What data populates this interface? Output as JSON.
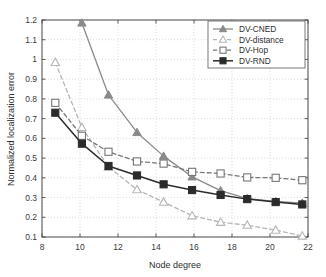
{
  "chart_data": {
    "type": "line",
    "title": "",
    "xlabel": "Node degree",
    "ylabel": "Normalized localization error",
    "xlim": [
      8,
      22
    ],
    "ylim": [
      0.1,
      1.2
    ],
    "xticks": [
      8,
      10,
      12,
      14,
      16,
      18,
      20,
      22
    ],
    "yticks": [
      0.1,
      0.2,
      0.3,
      0.4,
      0.5,
      0.6,
      0.7,
      0.8,
      0.9,
      1.0,
      1.1,
      1.2
    ],
    "ytick_labels": [
      "0.1",
      "0.2",
      "0.3",
      "0.4",
      "0.5",
      "0.6",
      "0.7",
      "0.8",
      "0.9",
      "1",
      "1.1",
      "1.2"
    ],
    "xtick_labels": [
      "8",
      "10",
      "12",
      "14",
      "16",
      "18",
      "20",
      "22"
    ],
    "grid": true,
    "legend_position": "top-right",
    "series": [
      {
        "name": "DV-CNED",
        "color": "#8a8a8a",
        "marker": "triangle-filled",
        "linestyle": "solid",
        "x": [
          10.1,
          11.5,
          13.0,
          14.4,
          15.9,
          17.4,
          18.8,
          20.3,
          21.7
        ],
        "y": [
          1.185,
          0.82,
          0.63,
          0.51,
          0.405,
          0.335,
          0.295,
          0.28,
          0.272
        ]
      },
      {
        "name": "DV-distance",
        "color": "#b6b6b6",
        "marker": "triangle-open",
        "linestyle": "dashed",
        "x": [
          8.7,
          10.1,
          11.5,
          13.0,
          14.4,
          15.9,
          17.4,
          18.8,
          20.3,
          21.7
        ],
        "y": [
          0.985,
          0.655,
          0.455,
          0.34,
          0.277,
          0.208,
          0.175,
          0.16,
          0.135,
          0.105
        ]
      },
      {
        "name": "DV-Hop",
        "color": "#777777",
        "marker": "square-open",
        "linestyle": "dashed",
        "x": [
          8.7,
          10.1,
          11.5,
          13.0,
          14.4,
          15.9,
          17.4,
          18.8,
          20.3,
          21.7
        ],
        "y": [
          0.78,
          0.613,
          0.532,
          0.483,
          0.472,
          0.43,
          0.422,
          0.402,
          0.4,
          0.388
        ]
      },
      {
        "name": "DV-RND",
        "color": "#2b2b2b",
        "marker": "square-filled",
        "linestyle": "solid",
        "x": [
          8.7,
          10.1,
          11.5,
          13.0,
          14.4,
          15.9,
          17.4,
          18.8,
          20.3,
          21.7
        ],
        "y": [
          0.73,
          0.573,
          0.46,
          0.412,
          0.367,
          0.338,
          0.313,
          0.292,
          0.277,
          0.265
        ]
      }
    ]
  },
  "legend": {
    "items": [
      {
        "label": "DV-CNED"
      },
      {
        "label": "DV-distance"
      },
      {
        "label": "DV-Hop"
      },
      {
        "label": "DV-RND"
      }
    ]
  },
  "axes": {
    "x_label": "Node degree",
    "y_label": "Normalized localization error"
  }
}
